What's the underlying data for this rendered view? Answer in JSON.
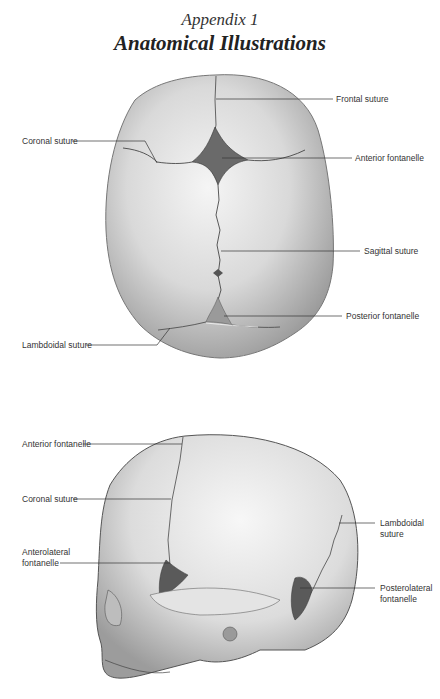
{
  "header": {
    "subtitle": "Appendix 1",
    "title": "Anatomical Illustrations"
  },
  "top_view": {
    "labels": {
      "frontal_suture": "Frontal suture",
      "coronal_suture": "Coronal suture",
      "anterior_fontanelle": "Anterior fontanelle",
      "sagittal_suture": "Sagittal suture",
      "posterior_fontanelle": "Posterior fontanelle",
      "lambdoidal_suture": "Lambdoidal suture"
    }
  },
  "side_view": {
    "labels": {
      "anterior_fontanelle": "Anterior fontanelle",
      "coronal_suture": "Coronal suture",
      "lambdoidal_suture_line1": "Lambdoidal",
      "lambdoidal_suture_line2": "suture",
      "anterolateral_fontanelle_line1": "Anterolateral",
      "anterolateral_fontanelle_line2": "fontanelle",
      "posterolateral_fontanelle_line1": "Posterolateral",
      "posterolateral_fontanelle_line2": "fontanelle"
    }
  },
  "colors": {
    "bone_light": "#eeeeee",
    "bone_mid": "#c8c8c8",
    "bone_dark": "#8a8a8a",
    "fontanelle": "#5a5a5a",
    "leader_line": "#333333"
  }
}
